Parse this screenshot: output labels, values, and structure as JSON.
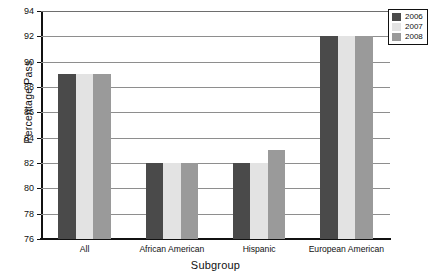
{
  "chart_data": {
    "type": "bar",
    "title": "",
    "xlabel": "Subgroup",
    "ylabel": "Percentage Pass",
    "categories": [
      "All",
      "African American",
      "Hispanic",
      "European American"
    ],
    "series": [
      {
        "name": "2006",
        "color": "#4a4a4a",
        "values": [
          89,
          82,
          82,
          92
        ]
      },
      {
        "name": "2007",
        "color": "#e3e3e3",
        "values": [
          89,
          82,
          82,
          92
        ]
      },
      {
        "name": "2008",
        "color": "#9a9a9a",
        "values": [
          89,
          82,
          83,
          92
        ]
      }
    ],
    "ylim": [
      76,
      94
    ],
    "ytick_step": 2,
    "yticks": [
      94,
      92,
      90,
      88,
      86,
      84,
      82,
      80,
      78,
      76
    ],
    "ytick_labels": [
      "94",
      "92",
      "90",
      "88",
      "86",
      "84",
      "82",
      "80",
      "78",
      "76"
    ],
    "grid": true,
    "legend_position": "top-right"
  },
  "axis": {
    "y_title": "Percentage Pass",
    "x_title": "Subgroup"
  },
  "legend": {
    "entries": [
      {
        "label": "2006",
        "color": "#4a4a4a"
      },
      {
        "label": "2007",
        "color": "#e3e3e3"
      },
      {
        "label": "2008",
        "color": "#9a9a9a"
      }
    ]
  }
}
